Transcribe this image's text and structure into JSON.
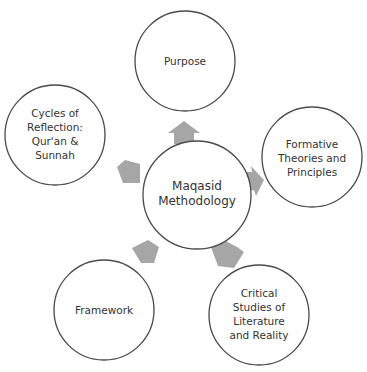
{
  "diagram": {
    "type": "radial-cycle",
    "colors": {
      "circle_stroke": "#4a4a4a",
      "circle_fill": "#ffffff",
      "arrow_fill": "#a6a6a6",
      "text": "#333333"
    },
    "center": {
      "lines": [
        "Maqasid",
        "Methodology"
      ]
    },
    "nodes": [
      {
        "id": "purpose",
        "lines": [
          "Purpose"
        ]
      },
      {
        "id": "formative",
        "lines": [
          "Formative",
          "Theories and",
          "Principles"
        ]
      },
      {
        "id": "critical",
        "lines": [
          "Critical",
          "Studies of",
          "Literature",
          "and Reality"
        ]
      },
      {
        "id": "framework",
        "lines": [
          "Framework"
        ]
      },
      {
        "id": "cycles",
        "lines": [
          "Cycles of",
          "Reflection:",
          "Qur'an &",
          "Sunnah"
        ]
      }
    ]
  }
}
